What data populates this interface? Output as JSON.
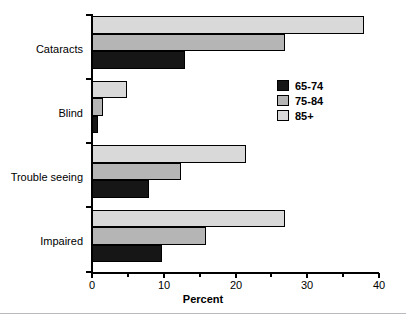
{
  "chart_data": {
    "type": "bar",
    "orientation": "horizontal",
    "title": "",
    "xlabel": "Percent",
    "ylabel": "",
    "xlim": [
      0,
      40
    ],
    "xticks": [
      0,
      10,
      20,
      30,
      40
    ],
    "xtick_labels": [
      "0",
      "10",
      "20",
      "30",
      "40"
    ],
    "xticks_minor": [
      5,
      15,
      25,
      35
    ],
    "grid": false,
    "legend_position": "upper right",
    "categories": [
      "Cataracts",
      "Blind",
      "Trouble seeing",
      "Impaired"
    ],
    "series": [
      {
        "name": "65-74",
        "color": "#161616",
        "values": [
          13.0,
          0.8,
          8.0,
          9.8
        ]
      },
      {
        "name": "75-84",
        "color": "#b5b5b5",
        "values": [
          27.0,
          1.5,
          12.4,
          16.0
        ]
      },
      {
        "name": "85+",
        "color": "#d9d9d9",
        "values": [
          38.0,
          4.9,
          21.5,
          27.0
        ]
      }
    ]
  },
  "legend": {
    "entries": [
      {
        "label": "65-74"
      },
      {
        "label": "75-84"
      },
      {
        "label": "85+"
      }
    ]
  },
  "axis": {
    "x_title": "Percent"
  }
}
